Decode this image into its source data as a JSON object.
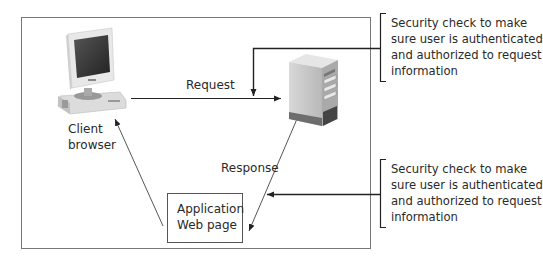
{
  "diagram": {
    "nodes": {
      "client": {
        "label_line1": "Client",
        "label_line2": "browser",
        "icon": "desktop-computer-icon"
      },
      "server": {
        "icon": "server-tower-icon"
      },
      "app_page": {
        "label_line1": "Application",
        "label_line2": "Web page"
      }
    },
    "edges": {
      "request": {
        "label": "Request",
        "from": "client",
        "to": "server"
      },
      "response": {
        "label": "Response",
        "from": "server",
        "to": "app_page"
      },
      "app_to_client": {
        "from": "app_page",
        "to": "client"
      }
    },
    "annotations": {
      "top": {
        "lines": [
          "Security check to make",
          "sure user is authenticated",
          "and authorized to request",
          "information"
        ],
        "points_to": "request"
      },
      "bottom": {
        "lines": [
          "Security check to make",
          "sure user is authenticated",
          "and authorized to request",
          "information"
        ],
        "points_to": "response"
      }
    },
    "colors": {
      "line": "#333333",
      "frame": "#777777",
      "text": "#2a2a2a"
    }
  }
}
